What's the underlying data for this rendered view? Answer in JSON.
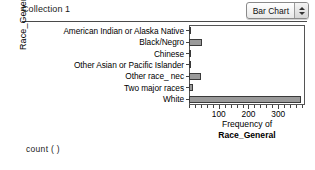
{
  "header": {
    "collection_title": "Collection 1",
    "chart_type_label": "Bar Chart",
    "stepper_up_icon": "triangle-up-icon",
    "stepper_down_icon": "triangle-down-icon"
  },
  "formula": {
    "text": "count (  )"
  },
  "chart_data": {
    "type": "bar",
    "orientation": "horizontal",
    "title": "",
    "xlabel_line1": "Frequency of",
    "xlabel_line2": "Race_General",
    "ylabel": "Race_General",
    "categories": [
      "American Indian or Alaska Native",
      "Black/Negro",
      "Chinese",
      "Other Asian or Pacific Islander",
      "Other race_ nec",
      "Two major races",
      "White"
    ],
    "values": [
      2,
      45,
      1,
      2,
      40,
      12,
      375
    ],
    "xlim": [
      0,
      390
    ],
    "xticks_major": [
      100,
      200,
      300
    ],
    "xtick_labels": [
      "100",
      "200",
      "300"
    ],
    "xticks_minor_step": 20,
    "grid": false,
    "legend": "none",
    "bar_color": "#9a9a9a",
    "bar_border_color": "#3a3a3a"
  }
}
